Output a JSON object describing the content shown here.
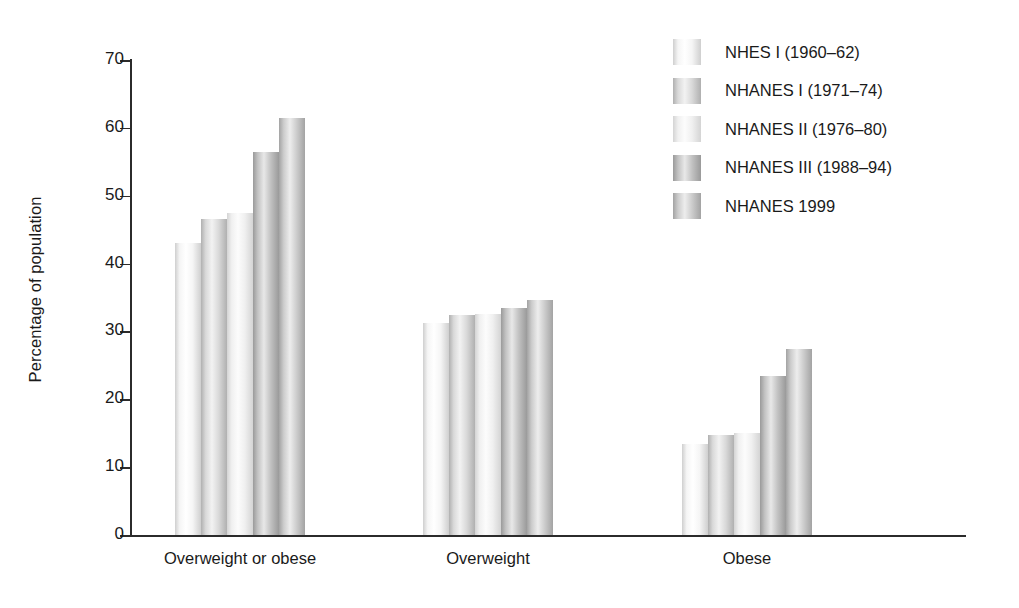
{
  "chart_data": {
    "type": "bar",
    "title": "",
    "subtitle": "",
    "xlabel": "",
    "ylabel": "Percentage of population",
    "ylim": [
      0,
      70
    ],
    "ytick_step": 10,
    "yticks": [
      0,
      10,
      20,
      30,
      40,
      50,
      60,
      70
    ],
    "ytick_labels": [
      "0",
      "10",
      "20",
      "30",
      "40",
      "50",
      "60",
      "70"
    ],
    "grid": false,
    "legend_position": "top-right",
    "categories": [
      "Overweight or obese",
      "Overweight",
      "Obese"
    ],
    "series": [
      {
        "name": "NHES I (1960–62)",
        "values": [
          43.1,
          31.2,
          13.4
        ]
      },
      {
        "name": "NHANES I (1971–74)",
        "values": [
          46.5,
          32.4,
          14.7
        ]
      },
      {
        "name": "NHANES II (1976–80)",
        "values": [
          47.5,
          32.5,
          15.1
        ]
      },
      {
        "name": "NHANES III (1988–94)",
        "values": [
          56.4,
          33.5,
          23.4
        ]
      },
      {
        "name": "NHANES 1999",
        "values": [
          61.4,
          34.7,
          27.4
        ]
      }
    ],
    "series_colors": {
      "NHES I (1960–62)": {
        "light": "#f5f5f5",
        "mid": "#ffffff",
        "dark": "#cfcfcf"
      },
      "NHANES I (1971–74)": {
        "light": "#d9d9d9",
        "mid": "#f2f2f2",
        "dark": "#b0b0b0"
      },
      "NHANES II (1976–80)": {
        "light": "#f0f0f0",
        "mid": "#fcfcfc",
        "dark": "#d4d4d4"
      },
      "NHANES III (1988–94)": {
        "light": "#c2c2c2",
        "mid": "#e8e8e8",
        "dark": "#9a9a9a"
      },
      "NHANES 1999": {
        "light": "#cccccc",
        "mid": "#ededed",
        "dark": "#a3a3a3"
      }
    },
    "axis_color": "#2b2b2b",
    "background_color": "#ffffff"
  },
  "legend": {
    "entries": [
      "NHES I (1960–62)",
      "NHANES I (1971–74)",
      "NHANES II (1976–80)",
      "NHANES III (1988–94)",
      "NHANES 1999"
    ]
  }
}
